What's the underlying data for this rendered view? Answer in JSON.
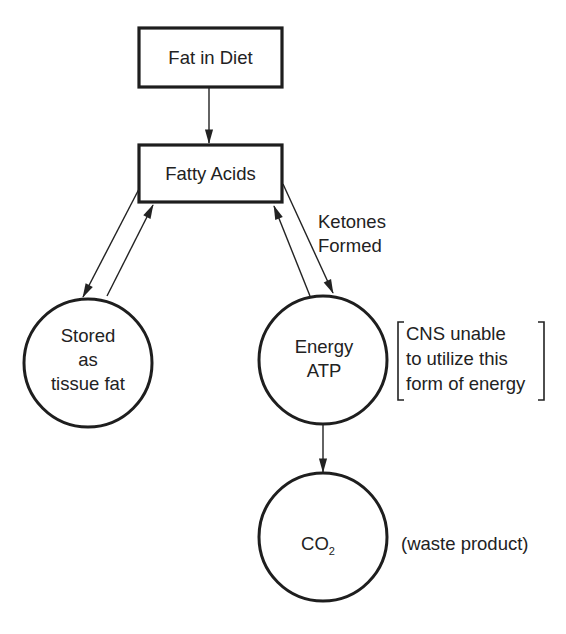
{
  "diagram": {
    "type": "flowchart",
    "nodes": {
      "fat_in_diet": {
        "label": "Fat in Diet",
        "shape": "rectangle"
      },
      "fatty_acids": {
        "label": "Fatty Acids",
        "shape": "rectangle"
      },
      "stored": {
        "shape": "circle",
        "lines": [
          "Stored",
          "as",
          "tissue fat"
        ]
      },
      "energy": {
        "shape": "circle",
        "lines": [
          "Energy",
          "ATP"
        ]
      },
      "co2": {
        "shape": "circle",
        "label_main": "CO",
        "label_sub": "2"
      }
    },
    "annotations": {
      "ketones": [
        "Ketones",
        "Formed"
      ],
      "cns_note": [
        "CNS unable",
        "to utilize this",
        "form of energy"
      ],
      "waste": "(waste product)"
    },
    "edges": [
      {
        "from": "Fat in Diet",
        "to": "Fatty Acids"
      },
      {
        "from": "Fatty Acids",
        "to": "Stored as tissue fat"
      },
      {
        "from": "Stored as tissue fat",
        "to": "Fatty Acids"
      },
      {
        "from": "Fatty Acids",
        "to": "Energy ATP",
        "label": "Ketones Formed"
      },
      {
        "from": "Energy ATP",
        "to": "Fatty Acids"
      },
      {
        "from": "Energy ATP",
        "to": "CO2"
      }
    ],
    "colors": {
      "stroke": "#1e1e1e",
      "text": "#222222",
      "background": "#ffffff"
    }
  }
}
